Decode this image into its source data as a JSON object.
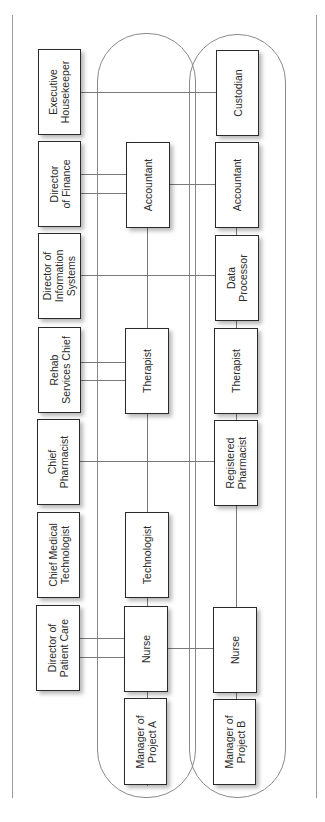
{
  "diagram": {
    "type": "project matrix organization chart",
    "functional_managers": [
      {
        "id": "exec-housekeeper",
        "label": "Executive\nHousekeeper"
      },
      {
        "id": "dir-finance",
        "label": "Director\nof Finance"
      },
      {
        "id": "dir-info-systems",
        "label": "Director of\nInformation\nSystems"
      },
      {
        "id": "rehab-chief",
        "label": "Rehab\nServices Chief"
      },
      {
        "id": "chief-pharmacist",
        "label": "Chief\nPharmacist"
      },
      {
        "id": "chief-med-tech",
        "label": "Chief Medical\nTechnologist"
      },
      {
        "id": "dir-patient-care",
        "label": "Director of\nPatient Care"
      }
    ],
    "project_a": {
      "members": [
        {
          "id": "a-accountant",
          "label": "Accountant"
        },
        {
          "id": "a-therapist",
          "label": "Therapist"
        },
        {
          "id": "a-technologist",
          "label": "Technologist"
        },
        {
          "id": "a-nurse",
          "label": "Nurse"
        },
        {
          "id": "a-manager",
          "label": "Manager of\nProject A"
        }
      ]
    },
    "project_b": {
      "members": [
        {
          "id": "b-custodian",
          "label": "Custodian"
        },
        {
          "id": "b-accountant",
          "label": "Accountant"
        },
        {
          "id": "b-data-processor",
          "label": "Data\nProcessor"
        },
        {
          "id": "b-therapist",
          "label": "Therapist"
        },
        {
          "id": "b-reg-pharmacist",
          "label": "Registered\nPharmacist"
        },
        {
          "id": "b-nurse",
          "label": "Nurse"
        },
        {
          "id": "b-manager",
          "label": "Manager of\nProject B"
        }
      ]
    },
    "connections": [
      [
        "exec-housekeeper",
        "b-custodian"
      ],
      [
        "dir-finance",
        "a-accountant"
      ],
      [
        "dir-finance",
        "a-accountant"
      ],
      [
        "a-accountant",
        "b-accountant"
      ],
      [
        "dir-info-systems",
        "b-data-processor"
      ],
      [
        "rehab-chief",
        "a-therapist"
      ],
      [
        "rehab-chief",
        "a-therapist"
      ],
      [
        "chief-pharmacist",
        "b-reg-pharmacist"
      ],
      [
        "dir-patient-care",
        "a-nurse"
      ],
      [
        "dir-patient-care",
        "a-nurse"
      ],
      [
        "a-nurse",
        "b-nurse"
      ]
    ]
  }
}
